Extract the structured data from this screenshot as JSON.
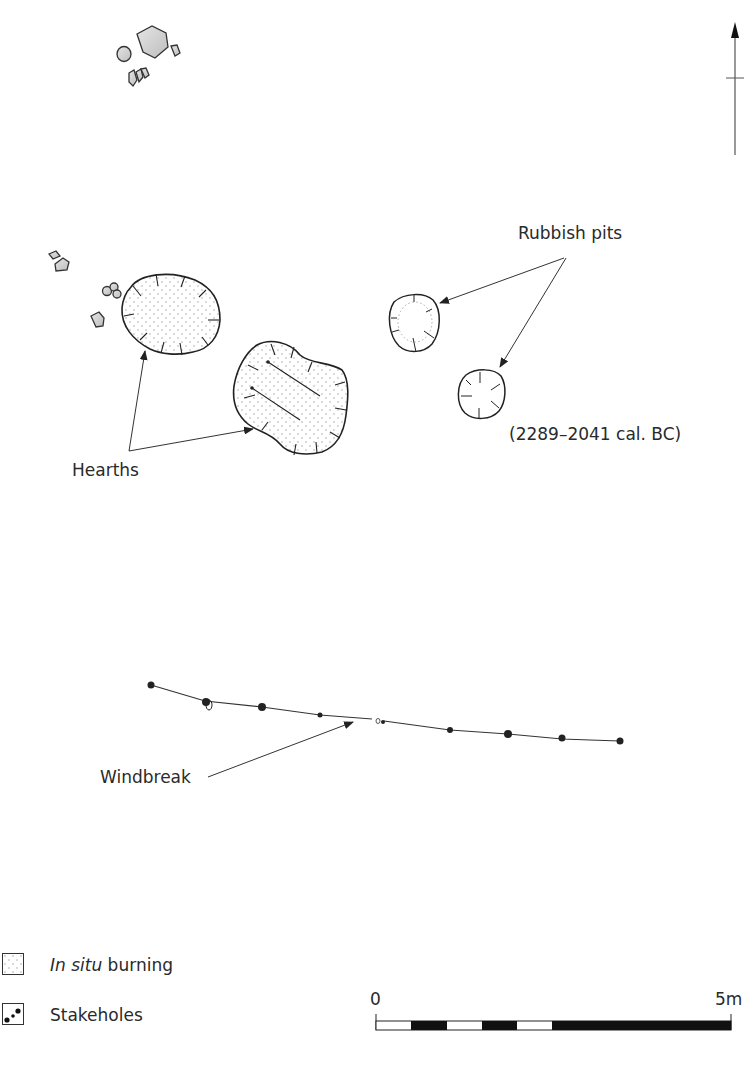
{
  "figure": {
    "type": "archaeological site plan",
    "north_arrow": "north-arrow-icon"
  },
  "labels": {
    "rubbish_pits": "Rubbish pits",
    "date_range": "(2289–2041 cal. BC)",
    "hearths": "Hearths",
    "windbreak": "Windbreak"
  },
  "legend": {
    "items": [
      {
        "symbol": "stippled-box",
        "label_italic": "In situ",
        "label_rest": " burning"
      },
      {
        "symbol": "stakeholes-box",
        "label": "Stakeholes"
      }
    ]
  },
  "scale_bar": {
    "start_label": "0",
    "end_label": "5m",
    "segments": [
      "white",
      "black",
      "white",
      "black",
      "white",
      "black"
    ]
  },
  "colors": {
    "ink": "#222222",
    "stone_fill": "#cfcfcf",
    "stipple": "#9a9a9a",
    "background": "#ffffff"
  }
}
